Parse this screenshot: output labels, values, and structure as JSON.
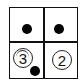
{
  "puzzle": {
    "rows": 2,
    "cols": 2,
    "cells": [
      {
        "row": 0,
        "col": 0,
        "content": "dot"
      },
      {
        "row": 0,
        "col": 1,
        "content": "dot"
      },
      {
        "row": 1,
        "col": 0,
        "content": "circled-number",
        "number": "3",
        "extra": "dot"
      },
      {
        "row": 1,
        "col": 1,
        "content": "circled-number",
        "number": "2"
      }
    ],
    "labels": {
      "cell_10_number": "3",
      "cell_11_number": "2"
    },
    "colors": {
      "line": "#111111",
      "dot": "#000000",
      "background": "#ffffff"
    }
  }
}
